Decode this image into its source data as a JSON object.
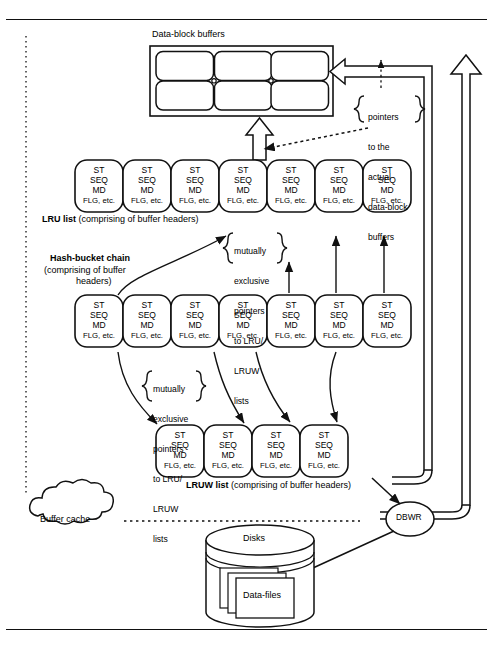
{
  "figure": {
    "title_top_rule": true,
    "bottom_rule": true
  },
  "labels": {
    "data_block_buffers": "Data-block buffers",
    "lru_list_bold": "LRU list",
    "lru_list_rest": " (comprising of buffer headers)",
    "hash_bucket_bold": "Hash-bucket chain",
    "hash_bucket_rest_1": "(comprising of buffer",
    "hash_bucket_rest_2": "headers)",
    "lruw_list_bold": "LRUW list",
    "lruw_list_rest": " (comprising of buffer headers)",
    "buffer_cache": "Buffer cache",
    "disks": "Disks",
    "data_files": "Data-files",
    "dbwr": "DBWR"
  },
  "annotations": {
    "pointers_actual": [
      "pointers",
      "to the",
      "actual",
      "data-block",
      "buffers"
    ],
    "mutually_exclusive_upper": [
      "mutually",
      "exclusive",
      "pointers",
      "to LRU/",
      "LRUW",
      "lists"
    ],
    "mutually_exclusive_lower": [
      "mutually",
      "exclusive",
      "pointers",
      "to LRU/",
      "LRUW",
      "lists"
    ]
  },
  "buffer_header": {
    "line1": "ST",
    "line2": "SEQ",
    "line3": "MD",
    "line4": "FLG, etc."
  },
  "rows": {
    "lru": {
      "name": "LRU list",
      "count": 7,
      "y": 160
    },
    "hash": {
      "name": "Hash-bucket chain",
      "count": 7,
      "y": 295
    },
    "lruw": {
      "name": "LRUW list",
      "count": 4,
      "y": 425
    }
  },
  "data_block_grid": {
    "cols": 3,
    "rows": 2
  },
  "colors": {
    "stroke": "#111111",
    "fill": "#ffffff",
    "shadow": "#8a8a8a"
  }
}
